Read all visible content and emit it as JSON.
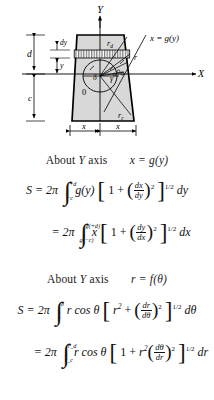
{
  "figure": {
    "axes": {
      "y_label": "Y",
      "x_label": "X"
    },
    "labels": {
      "origin": "0",
      "dim_d": "d",
      "dim_c": "c",
      "strip_dy": "dy",
      "height_y": "y",
      "radius_top": "r_d",
      "radius_bottom": "r_c",
      "radius_r": "r",
      "angle_delta": "δ",
      "angle_gamma": "γ",
      "curve_eq": "x = g(y)",
      "width_left": "x",
      "width_right": "x"
    },
    "colors": {
      "body_fill": "#d9d9d9",
      "outline": "#000000",
      "strip_fill": "#ffffff",
      "hatch": "#333333"
    }
  },
  "sections": [
    {
      "caption_about": "About",
      "caption_axis": "Y",
      "caption_suffix": "axis",
      "caption_relation": "x = g(y)",
      "equations": [
        {
          "lhs": "S = 2π",
          "limit_upper": "+d",
          "limit_lower": "−c",
          "integrand_lead": "g(y)",
          "bracket_lead": "1 +",
          "frac_num": "dx",
          "frac_den": "dy",
          "frac_exp": "2",
          "bracket_exp": "1/2",
          "differential": "dy"
        },
        {
          "lhs": "= 2π",
          "limit_upper": "g(+d)",
          "limit_lower": "g(−c)",
          "integrand_lead": "x",
          "bracket_lead": "1 +",
          "frac_num": "dy",
          "frac_den": "dx",
          "frac_exp": "2",
          "bracket_exp": "1/2",
          "differential": "dx"
        }
      ]
    },
    {
      "caption_about": "About",
      "caption_axis": "Y",
      "caption_suffix": "axis",
      "caption_relation": "r = f(θ)",
      "equations": [
        {
          "lhs": "S = 2π",
          "limit_upper": "δ",
          "limit_lower": "γ",
          "integrand_lead": "r cos θ",
          "bracket_lead": "r",
          "bracket_lead_exp": "2",
          "bracket_op": "+",
          "frac_num": "dr",
          "frac_den": "dθ",
          "frac_exp": "2",
          "bracket_exp": "1/2",
          "differential": "dθ"
        },
        {
          "lhs": "= 2π",
          "limit_upper": "r_d",
          "limit_lower": "r_c",
          "integrand_lead": "r cos θ",
          "bracket_lead": "1 +",
          "bracket_mid": "r",
          "bracket_mid_exp": "2",
          "frac_num": "dθ",
          "frac_den": "dr",
          "frac_exp": "2",
          "bracket_exp": "1/2",
          "differential": "dr"
        }
      ]
    }
  ]
}
